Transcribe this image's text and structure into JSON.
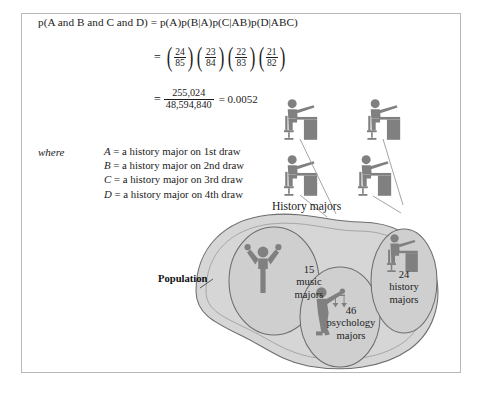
{
  "figure": {
    "equation": {
      "line1_left": "p(A and B and C and D)",
      "line1_right": "p(A)p(B|A)p(C|AB)p(D|ABC)",
      "equals": "=",
      "fractions": [
        {
          "num": "24",
          "den": "85"
        },
        {
          "num": "23",
          "den": "84"
        },
        {
          "num": "22",
          "den": "83"
        },
        {
          "num": "21",
          "den": "82"
        }
      ],
      "result_fraction": {
        "num": "255,024",
        "den": "48,594,840"
      },
      "result_value": "= 0.0052"
    },
    "where": {
      "word": "where",
      "items": [
        {
          "symbol": "A",
          "eq": "=",
          "text": "a history major on 1st draw"
        },
        {
          "symbol": "B",
          "eq": "=",
          "text": "a history major on 2nd draw"
        },
        {
          "symbol": "C",
          "eq": "=",
          "text": "a history major on 3rd draw"
        },
        {
          "symbol": "D",
          "eq": "=",
          "text": "a history major on 4th draw"
        }
      ]
    },
    "labels": {
      "history_majors": "History majors",
      "population": "Population"
    },
    "groups": [
      {
        "count": "15",
        "name_line1": "music",
        "name_line2": "majors",
        "icon": "person-arms-up-icon"
      },
      {
        "count": "46",
        "name_line1": "psychology",
        "name_line2": "majors",
        "icon": "person-scales-icon"
      },
      {
        "count": "24",
        "name_line1": "history",
        "name_line2": "majors",
        "icon": "person-at-desk-icon"
      }
    ],
    "colors": {
      "figure_gray": "#808080",
      "blob_fill": "#d6d6d6",
      "ellipse_fill": "#cfcfcf",
      "outline": "#6e6e6e",
      "border": "#b8b8b8",
      "text": "#1b1b1b"
    },
    "drawn_people_count": 4
  }
}
